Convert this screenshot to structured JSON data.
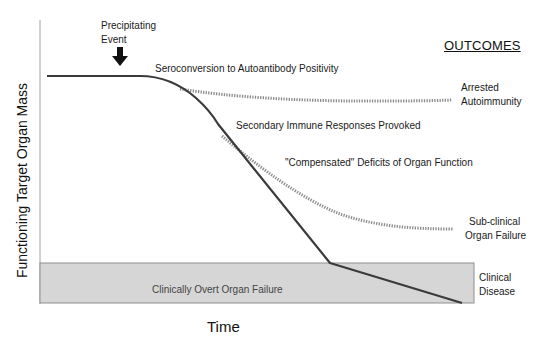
{
  "diagram": {
    "type": "disease-progression",
    "y_axis_label": "Functioning Target Organ Mass",
    "x_axis_label": "Time",
    "outcomes_header": "OUTCOMES",
    "annotations": {
      "precipitating_event": [
        "Precipitating",
        "Event"
      ],
      "seroconversion": "Seroconversion to Autoantibody Positivity",
      "secondary_responses": "Secondary Immune Responses Provoked",
      "compensated_deficits": "\"Compensated\" Deficits of Organ Function"
    },
    "zone": {
      "label": "Clinically Overt Organ Failure",
      "fill_color": "#d6d6d6"
    },
    "outcomes": [
      {
        "lines": [
          "Arrested",
          "Autoimmunity"
        ],
        "line_style": "dotted"
      },
      {
        "lines": [
          "Sub-clinical",
          "Organ Failure"
        ],
        "line_style": "dotted"
      },
      {
        "lines": [
          "Clinical",
          "Disease"
        ],
        "line_style": "solid"
      }
    ],
    "colors": {
      "main_line": "#3a3a3a",
      "dotted_line": "#8a8a8a",
      "axis": "#9a9a9a"
    }
  }
}
